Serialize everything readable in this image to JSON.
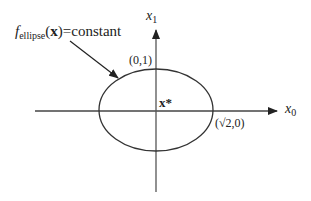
{
  "diagram": {
    "type": "ellipse-level-set",
    "colors": {
      "stroke": "#333333",
      "axis": "#555555",
      "text": "#222222",
      "background": "#ffffff"
    },
    "label_function": {
      "f": "f",
      "subscript": "ellipse",
      "arg": "(x)",
      "rest": "=constant"
    },
    "axes": {
      "vertical_label": "x",
      "vertical_label_sub": "1",
      "horizontal_label": "x",
      "horizontal_label_sub": "0"
    },
    "points": {
      "top": "(0,1)",
      "right": "(√2,0)",
      "center": "x*"
    }
  }
}
